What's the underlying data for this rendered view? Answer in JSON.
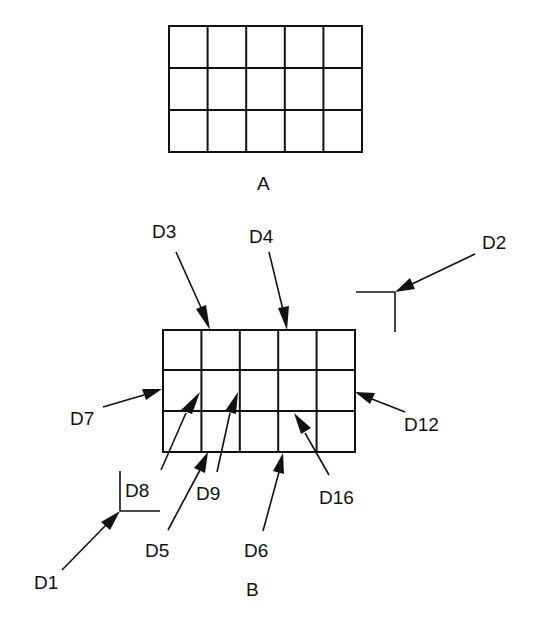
{
  "figure": {
    "title_a": "A",
    "title_b": "B",
    "grid_a": {
      "rows": 3,
      "cols": 5,
      "x": 169,
      "y": 26,
      "width": 193,
      "height": 126
    },
    "grid_b": {
      "rows": 3,
      "cols": 5,
      "x": 163,
      "y": 330,
      "width": 192,
      "height": 122
    },
    "stroke_color": "#111111",
    "background": "#ffffff"
  },
  "labels": {
    "d1": "D1",
    "d2": "D2",
    "d3": "D3",
    "d4": "D4",
    "d5": "D5",
    "d6": "D6",
    "d7": "D7",
    "d8": "D8",
    "d9": "D9",
    "d12": "D12",
    "d16": "D16"
  }
}
